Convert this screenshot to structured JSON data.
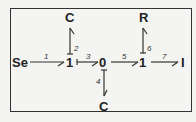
{
  "diagram": {
    "type": "bond-graph",
    "nodes": {
      "se": "Se",
      "j1a": "1",
      "j0": "0",
      "j1b": "1",
      "c_top": "C",
      "c_bottom": "C",
      "r": "R",
      "i": "I"
    },
    "bonds": {
      "b1": "1",
      "b2": "2",
      "b3": "3",
      "b4": "4",
      "b5": "5",
      "b6": "6",
      "b7": "7"
    },
    "colors": {
      "stroke": "#333333",
      "background": "#f4f4f2"
    }
  }
}
